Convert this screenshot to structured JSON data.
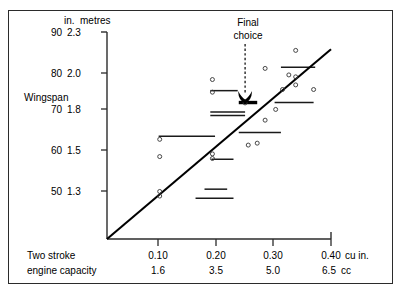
{
  "chart_data": {
    "type": "scatter",
    "title": "",
    "ylabel": "Wingspan",
    "y_unit_headers": {
      "left": "in.",
      "right": "metres"
    },
    "xlabel_line1": "Two stroke",
    "xlabel_line2": "engine capacity",
    "x_unit_top": "cu in.",
    "x_unit_bottom": "cc",
    "yticks_in": [
      "90",
      "80",
      "70",
      "60",
      "50"
    ],
    "yticks_m": [
      "2.3",
      "2.0",
      "1.8",
      "1.5",
      "1.3"
    ],
    "xticks_cuin": [
      "0.10",
      "0.20",
      "0.30",
      "0.40"
    ],
    "xticks_cc": [
      "1.6",
      "3.5",
      "5.0",
      "6.5"
    ],
    "ylim_in": [
      38,
      92
    ],
    "xlim_cuin": [
      0.0,
      0.425
    ],
    "grid": false,
    "legend": "none",
    "annotation": {
      "text_line1": "Final",
      "text_line2": "choice",
      "points_to_x": 0.262,
      "points_to_y_in": 73.5
    },
    "trend_line": {
      "x0": 0.0,
      "y0_in": 38.0,
      "x1": 0.425,
      "y1_in": 87.5
    },
    "points_cuin_in": [
      [
        0.1,
        64.0
      ],
      [
        0.1,
        59.5
      ],
      [
        0.1,
        50.4
      ],
      [
        0.1,
        49.2
      ],
      [
        0.2,
        79.6
      ],
      [
        0.2,
        76.3
      ],
      [
        0.2,
        60.2
      ],
      [
        0.2,
        59.0
      ],
      [
        0.262,
        73.5
      ],
      [
        0.285,
        63.0
      ],
      [
        0.268,
        62.5
      ],
      [
        0.3,
        82.5
      ],
      [
        0.3,
        69.0
      ],
      [
        0.32,
        71.8
      ],
      [
        0.333,
        77.0
      ],
      [
        0.345,
        80.8
      ],
      [
        0.358,
        87.2
      ],
      [
        0.358,
        80.3
      ],
      [
        0.358,
        78.2
      ],
      [
        0.392,
        77.0
      ]
    ],
    "range_bars_cuin_in": [
      {
        "x0": 0.098,
        "x1": 0.205,
        "y_in": 64.8,
        "thick": false
      },
      {
        "x0": 0.185,
        "x1": 0.228,
        "y_in": 51.0,
        "thick": false
      },
      {
        "x0": 0.168,
        "x1": 0.24,
        "y_in": 48.6,
        "thick": false
      },
      {
        "x0": 0.198,
        "x1": 0.24,
        "y_in": 58.8,
        "thick": false
      },
      {
        "x0": 0.196,
        "x1": 0.248,
        "y_in": 76.7,
        "thick": false
      },
      {
        "x0": 0.196,
        "x1": 0.262,
        "y_in": 71.1,
        "thick": false
      },
      {
        "x0": 0.196,
        "x1": 0.262,
        "y_in": 70.2,
        "thick": false
      },
      {
        "x0": 0.25,
        "x1": 0.285,
        "y_in": 73.6,
        "thick": true
      },
      {
        "x0": 0.25,
        "x1": 0.33,
        "y_in": 65.8,
        "thick": false
      },
      {
        "x0": 0.318,
        "x1": 0.392,
        "y_in": 73.6,
        "thick": false
      },
      {
        "x0": 0.33,
        "x1": 0.395,
        "y_in": 82.8,
        "thick": false
      }
    ]
  }
}
